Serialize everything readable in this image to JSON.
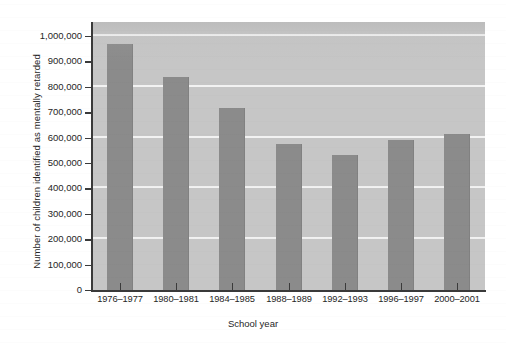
{
  "chart_data": {
    "type": "bar",
    "title": "",
    "xlabel": "School year",
    "ylabel": "Number of children identified as mentally retarded",
    "categories": [
      "1976–1977",
      "1980–1981",
      "1984–1985",
      "1988–1989",
      "1992–1993",
      "1996–1997",
      "2000–2001"
    ],
    "values": [
      970000,
      840000,
      715000,
      575000,
      530000,
      590000,
      615000
    ],
    "ylim": [
      0,
      1055000
    ],
    "ytick_values": [
      0,
      100000,
      200000,
      300000,
      400000,
      500000,
      600000,
      700000,
      800000,
      900000,
      1000000
    ],
    "ytick_labels": [
      "0",
      "100,000",
      "200,000",
      "300,000",
      "400,000",
      "500,000",
      "600,000",
      "700,000",
      "800,000",
      "900,000",
      "1,000,000"
    ],
    "gridline_values": [
      200000,
      400000,
      600000,
      800000,
      1000000
    ],
    "grid": true,
    "legend": "none",
    "series": [
      {
        "name": "Children identified as mentally retarded",
        "values": [
          970000,
          840000,
          715000,
          575000,
          530000,
          590000,
          615000
        ]
      }
    ]
  },
  "style": {
    "bar_color": "#8b8b8b",
    "plot_background": "#c6c6c6",
    "gridline_color": "#f2f2f2",
    "axis_color": "#3a3a3a",
    "page_background": "#ffffff",
    "text_color": "#262626"
  }
}
